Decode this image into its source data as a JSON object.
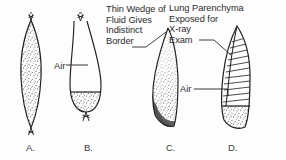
{
  "figure": {
    "background_color": "#fdfdfd",
    "ink_color": "#2b2b2b",
    "width": 286,
    "height": 160
  },
  "annotations": {
    "thin_wedge": {
      "text": "Thin Wedge of\nFluid Gives\nIndistinct\nBorder",
      "lines": [
        "Thin Wedge of",
        "Fluid Gives",
        "Indistinct",
        "Border"
      ],
      "points_to": "panel-c-upper-tip"
    },
    "lung_parenchyma": {
      "text": "Lung Parenchyma\nExposed for\nX-ray\nExam",
      "lines": [
        "Lung Parenchyma",
        "Exposed for",
        "X-ray",
        "Exam"
      ],
      "points_to": "panel-d-hatched-region"
    },
    "air_b": {
      "text": "Air",
      "points_to": "panel-b-air-space"
    },
    "air_d": {
      "text": "Air",
      "points_to": "panel-d-air-fluid-level"
    }
  },
  "panels": [
    {
      "id": "a",
      "letter": "A.",
      "shape": "lens-spindle",
      "fill": "stipple",
      "description": "Fully opacified lenticular fluid collection with tapered pleural tails at both poles"
    },
    {
      "id": "b",
      "letter": "B.",
      "shape": "inverted-teardrop",
      "fill": "air-above-fluid",
      "description": "Air in upper portion above a horizontal air-fluid level with stippled fluid below"
    },
    {
      "id": "c",
      "letter": "C.",
      "shape": "crescent-wedge",
      "fill": "stipple-graded",
      "description": "Crescentic wedge of fluid, dense inferiorly, thinning to an indistinct upper border"
    },
    {
      "id": "d",
      "letter": "D.",
      "shape": "elongated-lobe",
      "fill": "hatched-over-fluid",
      "description": "Hatched lung parenchyma above a horizontal air-fluid level with stippled fluid at the base"
    }
  ]
}
